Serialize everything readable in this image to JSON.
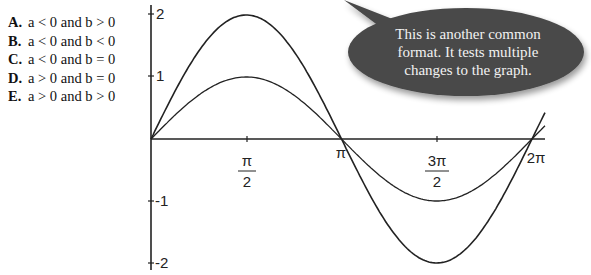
{
  "question": {
    "choices": [
      {
        "letter": "A.",
        "text": "a < 0 and b > 0"
      },
      {
        "letter": "B.",
        "text": "a < 0 and b < 0"
      },
      {
        "letter": "C.",
        "text": "a < 0 and b = 0"
      },
      {
        "letter": "D.",
        "text": "a > 0 and b = 0"
      },
      {
        "letter": "E.",
        "text": "a > 0 and b > 0"
      }
    ]
  },
  "callout": {
    "lines": [
      "This is another common",
      "format.  It tests multiple",
      "changes to the graph."
    ],
    "fill": "#4a4a4a"
  },
  "graph": {
    "y_ticks": [
      "2",
      "1",
      "-1",
      "-2"
    ],
    "x_ticks": [
      {
        "num": "π",
        "den": "2"
      },
      {
        "label": "π"
      },
      {
        "num": "3π",
        "den": "2"
      },
      {
        "label": "2π"
      }
    ]
  },
  "chart_data": {
    "type": "line",
    "title": "",
    "xlabel": "",
    "ylabel": "",
    "x_range": [
      0,
      6.5
    ],
    "ylim": [
      -2,
      2
    ],
    "x_tick_labels": [
      "π/2",
      "π",
      "3π/2",
      "2π"
    ],
    "y_tick_labels": [
      "2",
      "1",
      "-1",
      "-2"
    ],
    "series": [
      {
        "name": "y = sin x",
        "amplitude": 1,
        "period": "2π",
        "x": [
          0,
          1.5708,
          3.1416,
          4.7124,
          6.2832
        ],
        "y": [
          0,
          1,
          0,
          -1,
          0
        ]
      },
      {
        "name": "y = 2 sin x",
        "amplitude": 2,
        "period": "2π",
        "x": [
          0,
          1.5708,
          3.1416,
          4.7124,
          6.2832
        ],
        "y": [
          0,
          2,
          0,
          -2,
          0
        ]
      }
    ],
    "grid": false
  }
}
